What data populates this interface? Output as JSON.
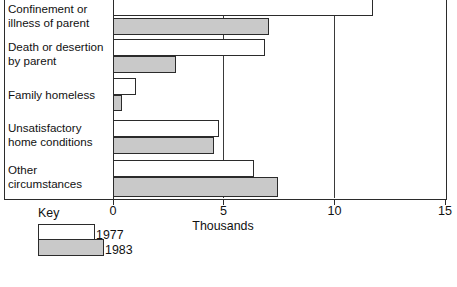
{
  "chart_data": {
    "type": "bar",
    "orientation": "horizontal",
    "title": "",
    "xlabel": "Thousands",
    "ylabel": "",
    "xlim": [
      0,
      15
    ],
    "xticks": [
      0,
      5,
      10,
      15
    ],
    "xtick_labels": [
      "0",
      "5",
      "10",
      "15"
    ],
    "grid": "vertical gridlines at 5 and 10",
    "legend_title": "Key",
    "legend_position": "below-left",
    "categories": [
      "Confinement or\nillness of parent",
      "Death or desertion\nby parent",
      "Family homeless",
      "Unsatisfactory\nhome conditions",
      "Other\ncircumstances"
    ],
    "series": [
      {
        "name": "1977",
        "color": "#ffffff",
        "values": [
          11.7,
          6.8,
          1.0,
          4.75,
          6.3
        ]
      },
      {
        "name": "1983",
        "color": "#c9c9c9",
        "values": [
          7.0,
          2.8,
          0.35,
          4.5,
          7.4
        ]
      }
    ],
    "note": "Top category bar is cropped by the top edge of the image"
  },
  "axis": {
    "ticks": [
      {
        "value": 0,
        "label": "0"
      },
      {
        "value": 5,
        "label": "5"
      },
      {
        "value": 10,
        "label": "10"
      },
      {
        "value": 15,
        "label": "15"
      }
    ],
    "title": "Thousands"
  },
  "legend": {
    "title": "Key",
    "entries": [
      {
        "label": "1977",
        "color": "#ffffff"
      },
      {
        "label": "1983",
        "color": "#c9c9c9"
      }
    ]
  },
  "colors": {
    "frame": "#2b2b2b",
    "bar_1977": "#ffffff",
    "bar_1983": "#c9c9c9",
    "text": "#111111",
    "background": "#ffffff"
  }
}
